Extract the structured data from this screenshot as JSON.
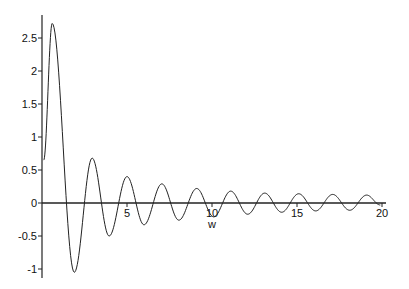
{
  "chart_data": {
    "type": "line",
    "title": "",
    "xlabel": "w",
    "ylabel": "",
    "xlim": [
      0,
      20
    ],
    "ylim": [
      -1.1,
      2.8
    ],
    "grid": false,
    "legend": null,
    "x_ticks": [
      5,
      10,
      15,
      20
    ],
    "x_tick_labels": [
      "5",
      "10",
      "15",
      "20"
    ],
    "y_ticks": [
      -1,
      -0.5,
      0,
      0.5,
      1,
      1.5,
      2,
      2.5
    ],
    "y_tick_labels": [
      "-1",
      "-0.5",
      "0",
      "0.5",
      "1",
      "1.5",
      "2",
      "2.5"
    ],
    "series": [
      {
        "name": "f(w)",
        "color": "#222222",
        "extrema": [
          {
            "x": 0.1,
            "y": 0.65
          },
          {
            "x": 0.6,
            "y": 2.72
          },
          {
            "x": 1.9,
            "y": -1.05
          },
          {
            "x": 2.95,
            "y": 0.68
          },
          {
            "x": 3.95,
            "y": -0.5
          },
          {
            "x": 5.0,
            "y": 0.4
          },
          {
            "x": 6.0,
            "y": -0.33
          },
          {
            "x": 7.05,
            "y": 0.29
          },
          {
            "x": 8.05,
            "y": -0.26
          },
          {
            "x": 9.1,
            "y": 0.22
          },
          {
            "x": 10.1,
            "y": -0.21
          },
          {
            "x": 11.1,
            "y": 0.18
          },
          {
            "x": 12.1,
            "y": -0.17
          },
          {
            "x": 13.1,
            "y": 0.15
          },
          {
            "x": 14.1,
            "y": -0.14
          },
          {
            "x": 15.1,
            "y": 0.14
          },
          {
            "x": 16.1,
            "y": -0.12
          },
          {
            "x": 17.1,
            "y": 0.13
          },
          {
            "x": 18.1,
            "y": -0.11
          },
          {
            "x": 19.1,
            "y": 0.12
          },
          {
            "x": 19.9,
            "y": -0.03
          }
        ]
      }
    ]
  }
}
